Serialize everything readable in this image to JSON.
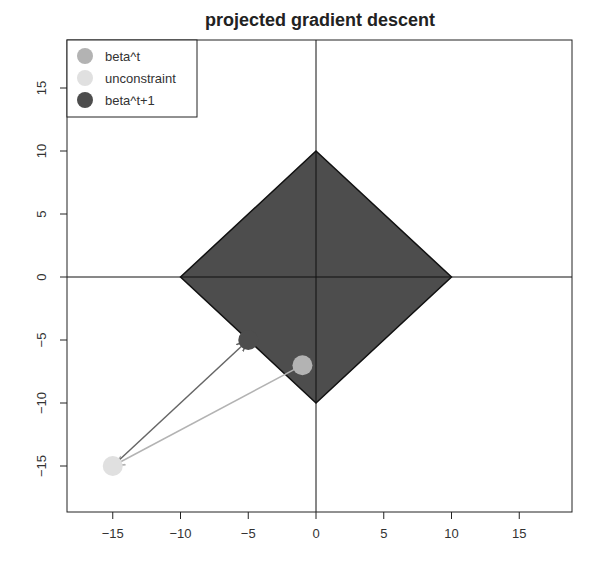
{
  "chart_data": {
    "type": "scatter",
    "title": "projected gradient descent",
    "xlabel": "",
    "ylabel": "",
    "xlim": [
      -18.5,
      18.5
    ],
    "ylim": [
      -18.5,
      18.5
    ],
    "x_ticks": [
      -15,
      -10,
      -5,
      0,
      5,
      10,
      15
    ],
    "y_ticks": [
      -15,
      -10,
      -5,
      0,
      5,
      10,
      15
    ],
    "x_tick_labels": [
      "−15",
      "−10",
      "−5",
      "0",
      "5",
      "10",
      "15"
    ],
    "y_tick_labels": [
      "−15",
      "−10",
      "−5",
      "0",
      "5",
      "10",
      "15"
    ],
    "grid": false,
    "reference_lines": [
      {
        "type": "hline",
        "y": 0
      },
      {
        "type": "vline",
        "x": 0
      }
    ],
    "constraint_region": {
      "shape": "L1 ball (diamond)",
      "radius": 10,
      "vertices": [
        [
          0,
          10
        ],
        [
          10,
          0
        ],
        [
          0,
          -10
        ],
        [
          -10,
          0
        ]
      ],
      "fill": "#4d4d4d"
    },
    "series": [
      {
        "name": "beta^t",
        "x": -1,
        "y": -7,
        "color": "#b3b3b3"
      },
      {
        "name": "unconstraint",
        "x": -15,
        "y": -15,
        "color": "#e0e0e0"
      },
      {
        "name": "beta^t+1",
        "x": -5,
        "y": -5,
        "color": "#4d4d4d"
      }
    ],
    "arrows": [
      {
        "from": [
          -1,
          -7
        ],
        "to": [
          -15,
          -15
        ],
        "color": "#b3b3b3"
      },
      {
        "from": [
          -15,
          -15
        ],
        "to": [
          -5,
          -5
        ],
        "color": "#666666"
      }
    ],
    "legend": {
      "position": "top-left",
      "entries": [
        "beta^t",
        "unconstraint",
        "beta^t+1"
      ]
    }
  }
}
